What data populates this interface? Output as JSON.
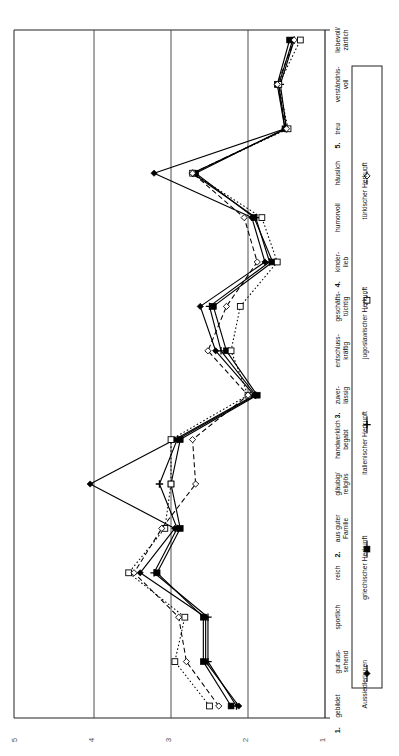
{
  "chart_data": {
    "type": "line",
    "title": "",
    "orientation": "rotated-90",
    "xlabel": "",
    "ylabel": "",
    "ylim": [
      5,
      1
    ],
    "ticks": [
      5,
      4,
      3,
      2,
      1
    ],
    "grid": true,
    "legend_position": "bottom-right",
    "categories": [
      "1. gebildet",
      "gut aus-\nsehend",
      "sportlich",
      "reich",
      "2. aus guter\nFamilie",
      "gläubig/\nreligiös",
      "handwerklich\nbegabt",
      "3. zuver-\nlässig",
      "entschluss-\nkräftig",
      "geschäfts-\ntüchtig",
      "4. kinder-\nlieb",
      "humorvoll",
      "häuslich",
      "5. treu",
      "verständnis-\nvoll",
      "liebevoll/\nzärtlich"
    ],
    "category_labels": [
      {
        "num": "1.",
        "text": "gebildet"
      },
      {
        "num": "",
        "text": "gut aus-|sehend"
      },
      {
        "num": "",
        "text": "sportlich"
      },
      {
        "num": "",
        "text": "reich"
      },
      {
        "num": "2.",
        "text": "aus guter|Familie"
      },
      {
        "num": "",
        "text": "gläubig/|religiös"
      },
      {
        "num": "",
        "text": "handwerklich|begabt"
      },
      {
        "num": "3.",
        "text": "zuver-|lässig"
      },
      {
        "num": "",
        "text": "entschluss-|kräftig"
      },
      {
        "num": "",
        "text": "geschäfts-|tüchtig"
      },
      {
        "num": "4.",
        "text": "kinder-|lieb"
      },
      {
        "num": "",
        "text": "humorvoll"
      },
      {
        "num": "",
        "text": "häuslich"
      },
      {
        "num": "5.",
        "text": "treu"
      },
      {
        "num": "",
        "text": "verständnis-|voll"
      },
      {
        "num": "",
        "text": "liebevoll/|zärtlich"
      }
    ],
    "series": [
      {
        "name": "Aussiedlerinnen",
        "marker": "filled-diamond",
        "dash": "solid",
        "values": [
          2.12,
          2.55,
          2.55,
          3.4,
          2.95,
          4.05,
          2.95,
          1.92,
          2.42,
          2.62,
          1.78,
          1.95,
          3.22,
          1.52,
          1.6,
          1.42
        ]
      },
      {
        "name": "griechischer Herkunft",
        "marker": "filled-square",
        "dash": "solid",
        "values": [
          2.22,
          2.58,
          2.58,
          3.18,
          2.88,
          3.0,
          2.88,
          1.88,
          2.28,
          2.45,
          1.68,
          1.92,
          2.68,
          1.52,
          1.62,
          1.46
        ]
      },
      {
        "name": "italienischer Herkunft",
        "marker": "plus",
        "dash": "solid",
        "values": [
          2.15,
          2.52,
          2.52,
          3.22,
          2.92,
          3.15,
          2.92,
          1.9,
          2.35,
          2.5,
          1.72,
          1.9,
          2.72,
          1.5,
          1.58,
          1.4
        ]
      },
      {
        "name": "jugoslawischer Herkunft",
        "marker": "open-square",
        "dash": "dotted",
        "values": [
          2.5,
          2.95,
          2.82,
          3.55,
          3.08,
          3.0,
          3.0,
          2.0,
          2.22,
          2.1,
          1.62,
          1.82,
          2.72,
          1.48,
          1.6,
          1.32
        ]
      },
      {
        "name": "türkischer Herkunft",
        "marker": "open-diamond",
        "dash": "dashed",
        "values": [
          2.38,
          2.8,
          2.9,
          3.48,
          3.12,
          2.68,
          2.72,
          2.0,
          2.52,
          2.28,
          1.88,
          2.05,
          2.72,
          1.5,
          1.62,
          1.4
        ]
      }
    ]
  },
  "legend": {
    "entries": [
      {
        "label": "Aussiedlerinnen",
        "marker": "filled-diamond",
        "dash": "solid"
      },
      {
        "label": "griechischer Herkunft",
        "marker": "filled-square",
        "dash": "solid"
      },
      {
        "label": "italienischer Herkunft",
        "marker": "plus",
        "dash": "solid"
      },
      {
        "label": "jugoslawischer Herkunft",
        "marker": "open-square",
        "dash": "dotted"
      },
      {
        "label": "türkischer Herkunft",
        "marker": "open-diamond",
        "dash": "dashed"
      }
    ]
  },
  "axis": {
    "tick_labels": [
      "5",
      "4",
      "3",
      "2",
      "1"
    ]
  },
  "colors": {
    "line": "#000000",
    "grid": "#3a3a3a",
    "axis": "#222222",
    "background": "#ffffff"
  }
}
